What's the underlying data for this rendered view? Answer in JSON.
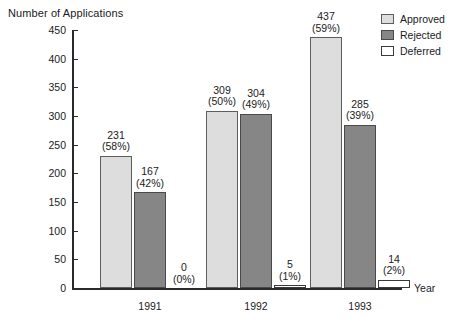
{
  "chart_data": {
    "type": "bar",
    "title": "",
    "xlabel": "Year",
    "ylabel": "Number of Applications",
    "categories": [
      "1991",
      "1992",
      "1993"
    ],
    "ylim": [
      0,
      450
    ],
    "ytick_step": 50,
    "yticks": [
      450,
      400,
      350,
      300,
      250,
      200,
      150,
      100,
      50,
      0
    ],
    "grid": false,
    "legend_position": "top-right",
    "series": [
      {
        "name": "Approved",
        "color": "#dddddd",
        "values": [
          231,
          309,
          437
        ],
        "percent_labels": [
          "(58%)",
          "(50%)",
          "(59%)"
        ],
        "percents": [
          58,
          50,
          59
        ]
      },
      {
        "name": "Rejected",
        "color": "#868686",
        "values": [
          167,
          304,
          285
        ],
        "percent_labels": [
          "(42%)",
          "(49%)",
          "(39%)"
        ],
        "percents": [
          42,
          49,
          39
        ]
      },
      {
        "name": "Deferred",
        "color": "#ffffff",
        "values": [
          0,
          5,
          14
        ],
        "percent_labels": [
          "(0%)",
          "(1%)",
          "(2%)"
        ],
        "percents": [
          0,
          1,
          2
        ]
      }
    ]
  },
  "axis": {
    "y_title": "Number of Applications",
    "x_title": "Year",
    "y_tick_labels": [
      "450",
      "400",
      "350",
      "300",
      "250",
      "200",
      "150",
      "100",
      "50",
      "0"
    ],
    "x_tick_labels": [
      "1991",
      "1992",
      "1993"
    ]
  },
  "legend": {
    "items": [
      {
        "label": "Approved",
        "swatch": "approved"
      },
      {
        "label": "Rejected",
        "swatch": "rejected"
      },
      {
        "label": "Deferred",
        "swatch": "deferred"
      }
    ]
  },
  "bar_labels": {
    "g0": [
      {
        "num": "231",
        "pct": "(58%)"
      },
      {
        "num": "167",
        "pct": "(42%)"
      },
      {
        "num": "0",
        "pct": "(0%)"
      }
    ],
    "g1": [
      {
        "num": "309",
        "pct": "(50%)"
      },
      {
        "num": "304",
        "pct": "(49%)"
      },
      {
        "num": "5",
        "pct": "(1%)"
      }
    ],
    "g2": [
      {
        "num": "437",
        "pct": "(59%)"
      },
      {
        "num": "285",
        "pct": "(39%)"
      },
      {
        "num": "14",
        "pct": "(2%)"
      }
    ]
  }
}
